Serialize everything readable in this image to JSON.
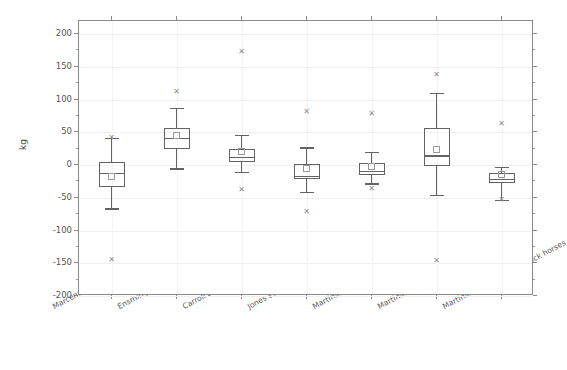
{
  "chart_data": {
    "type": "box",
    "title": "",
    "xlabel": "",
    "ylabel": "kg",
    "ylim": [
      -200,
      220
    ],
    "ytick_values": [
      200,
      150,
      100,
      50,
      0,
      -50,
      -100,
      -150,
      -200
    ],
    "ytick_labels": [
      "200",
      "150",
      "100",
      "50",
      "0",
      "-50",
      "-100",
      "-150",
      "-200"
    ],
    "grid": true,
    "legend": "none",
    "categories": [
      "Marcenac and Aublet (1964)",
      "Ensminger (1977)",
      "Carroll and Huntington (1988)",
      "Jones et al. (1989)",
      "Martinson et al. (2014)-Arabian",
      "Martinson et al. (2014)-Ponies",
      "Martinson et al. (2014)-Stock horses"
    ],
    "boxes": [
      {
        "category": "Marcenac and Aublet (1964)",
        "whisker_low": -66,
        "q1": -33,
        "median": -12,
        "mean": -18,
        "q3": 5,
        "whisker_high": 41,
        "outliers": [
          41,
          -145
        ]
      },
      {
        "category": "Ensminger (1977)",
        "whisker_low": -5,
        "q1": 25,
        "median": 41,
        "mean": 45,
        "q3": 57,
        "whisker_high": 87,
        "outliers": [
          112
        ]
      },
      {
        "category": "Carroll and Huntington (1988)",
        "whisker_low": -10,
        "q1": 4,
        "median": 13,
        "mean": 20,
        "q3": 25,
        "whisker_high": 46,
        "outliers": [
          172,
          -38
        ]
      },
      {
        "category": "Jones et al. (1989)",
        "whisker_low": -41,
        "q1": -22,
        "median": -16,
        "mean": -6,
        "q3": 2,
        "whisker_high": 27,
        "outliers": [
          81,
          -72
        ]
      },
      {
        "category": "Martinson et al. (2014)-Arabian",
        "whisker_low": -28,
        "q1": -15,
        "median": -9,
        "mean": -2,
        "q3": 3,
        "whisker_high": 20,
        "outliers": [
          78,
          -37
        ]
      },
      {
        "category": "Martinson et al. (2014)-Ponies",
        "whisker_low": -46,
        "q1": -2,
        "median": 15,
        "mean": 23,
        "q3": 56,
        "whisker_high": 110,
        "outliers": [
          137,
          -147
        ]
      },
      {
        "category": "Martinson et al. (2014)-Stock horses",
        "whisker_low": -53,
        "q1": -27,
        "median": -21,
        "mean": -15,
        "q3": -12,
        "whisker_high": -3,
        "outliers": [
          63,
          -53
        ]
      }
    ],
    "colors": {
      "box_edge": "#636363",
      "outlier": "#8c8c8c",
      "mean_marker": "#9a9a9a",
      "axis": "#8a8a8a",
      "grid": "#f0f0f0",
      "text": "#4a4a4a",
      "background": "#ffffff"
    }
  }
}
